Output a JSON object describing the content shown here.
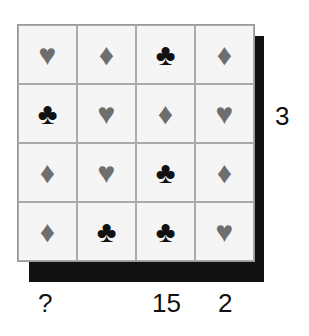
{
  "grid": {
    "rows": [
      [
        "heart",
        "diamond",
        "club",
        "diamond"
      ],
      [
        "club",
        "heart",
        "diamond",
        "heart"
      ],
      [
        "diamond",
        "heart",
        "club",
        "diamond"
      ],
      [
        "diamond",
        "club",
        "club",
        "heart"
      ]
    ]
  },
  "symbols": {
    "heart": "♥",
    "diamond": "♦",
    "club": "♣"
  },
  "colors": {
    "heart": "#6e6e6e",
    "diamond": "#6e6e6e",
    "club": "#111111"
  },
  "labels": {
    "row2_right": "3",
    "col1_bottom": "?",
    "col3_bottom": "15",
    "col4_bottom": "2"
  }
}
